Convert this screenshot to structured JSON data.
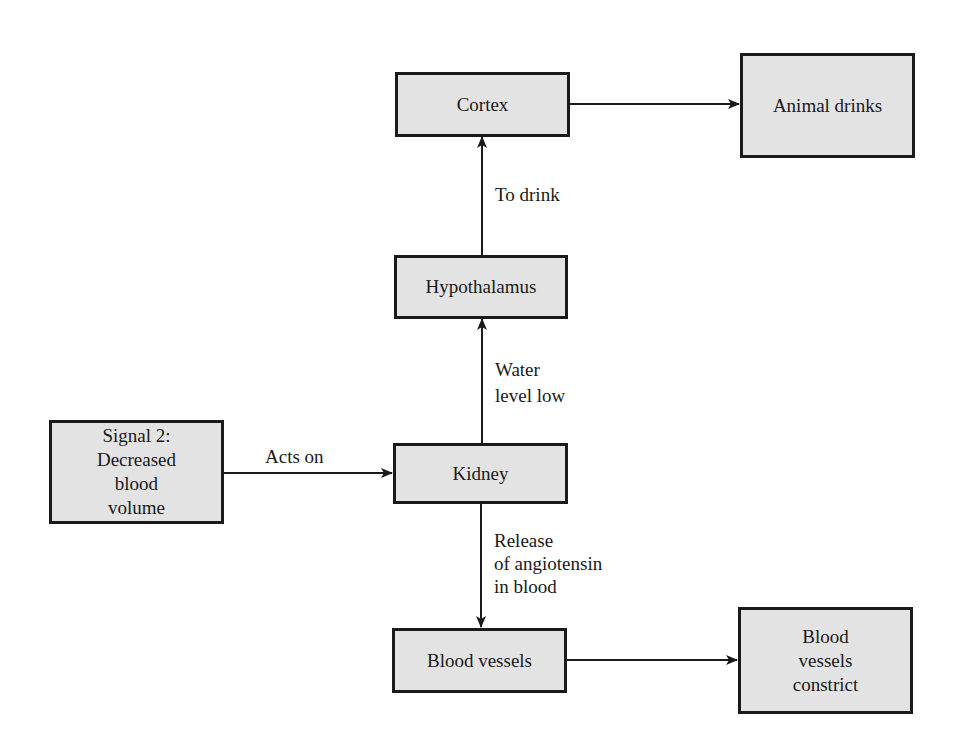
{
  "diagram": {
    "type": "flowchart",
    "nodes": {
      "cortex": "Cortex",
      "animal_drinks": "Animal drinks",
      "hypothalamus": "Hypothalamus",
      "signal": "Signal 2:\nDecreased\nblood\nvolume",
      "kidney": "Kidney",
      "blood_vessels": "Blood vessels",
      "blood_vessels_constrict": "Blood\nvessels\nconstrict"
    },
    "edge_labels": {
      "to_drink": "To drink",
      "water_level_low": "Water\nlevel low",
      "acts_on": "Acts on",
      "release_angiotensin": "Release\nof angiotensin\nin blood"
    },
    "edges": [
      {
        "from": "Signal 2: Decreased blood volume",
        "to": "Kidney",
        "label": "Acts on"
      },
      {
        "from": "Kidney",
        "to": "Hypothalamus",
        "label": "Water level low"
      },
      {
        "from": "Hypothalamus",
        "to": "Cortex",
        "label": "To drink"
      },
      {
        "from": "Cortex",
        "to": "Animal drinks",
        "label": ""
      },
      {
        "from": "Kidney",
        "to": "Blood vessels",
        "label": "Release of angiotensin in blood"
      },
      {
        "from": "Blood vessels",
        "to": "Blood vessels constrict",
        "label": ""
      }
    ],
    "colors": {
      "box_fill": "#e3e3e3",
      "stroke": "#1a1a1a"
    }
  }
}
